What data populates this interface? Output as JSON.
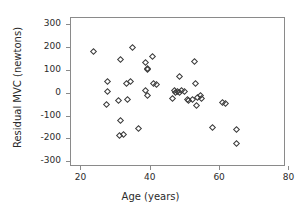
{
  "chart_data": {
    "type": "scatter",
    "title": "",
    "xlabel": "Age (years)",
    "ylabel": "Residual MVC (newtons)",
    "xlim": [
      17,
      79
    ],
    "ylim": [
      -320,
      330
    ],
    "xticks": [
      20,
      40,
      60,
      80
    ],
    "yticks": [
      300,
      200,
      100,
      0,
      -100,
      -200,
      -300
    ],
    "xtick_labels": [
      "20",
      "40",
      "60",
      "80"
    ],
    "ytick_labels": [
      "300",
      "200",
      "100",
      "0",
      "-100",
      "-200",
      "-300"
    ],
    "grid": false,
    "legend": null,
    "marker": "open-diamond",
    "marker_color": "#3a3a3a",
    "frame_color": "#8a8a8a",
    "points": [
      {
        "x": 23.4,
        "y": 182
      },
      {
        "x": 27.6,
        "y": 51
      },
      {
        "x": 27.6,
        "y": 8
      },
      {
        "x": 27.2,
        "y": -47
      },
      {
        "x": 31.2,
        "y": 147
      },
      {
        "x": 30.8,
        "y": -29
      },
      {
        "x": 31.4,
        "y": -115
      },
      {
        "x": 31.0,
        "y": -181
      },
      {
        "x": 32.0,
        "y": -179
      },
      {
        "x": 33.0,
        "y": 46
      },
      {
        "x": 34.2,
        "y": 52
      },
      {
        "x": 33.4,
        "y": -27
      },
      {
        "x": 34.8,
        "y": 202
      },
      {
        "x": 36.6,
        "y": -153
      },
      {
        "x": 38.6,
        "y": 136
      },
      {
        "x": 38.4,
        "y": 14
      },
      {
        "x": 39.0,
        "y": 110
      },
      {
        "x": 39.2,
        "y": 104
      },
      {
        "x": 39.0,
        "y": -9
      },
      {
        "x": 40.6,
        "y": 164
      },
      {
        "x": 40.8,
        "y": 44
      },
      {
        "x": 41.6,
        "y": 42
      },
      {
        "x": 46.2,
        "y": -21
      },
      {
        "x": 46.8,
        "y": 12
      },
      {
        "x": 47.2,
        "y": 6
      },
      {
        "x": 47.8,
        "y": 10
      },
      {
        "x": 48.4,
        "y": 4
      },
      {
        "x": 48.2,
        "y": 76
      },
      {
        "x": 49.0,
        "y": 12
      },
      {
        "x": 49.6,
        "y": 9
      },
      {
        "x": 50.6,
        "y": -25
      },
      {
        "x": 51.0,
        "y": -32
      },
      {
        "x": 52.0,
        "y": -24
      },
      {
        "x": 52.6,
        "y": 142
      },
      {
        "x": 52.8,
        "y": 44
      },
      {
        "x": 53.4,
        "y": -17
      },
      {
        "x": 53.2,
        "y": -50
      },
      {
        "x": 54.4,
        "y": -9
      },
      {
        "x": 54.6,
        "y": -22
      },
      {
        "x": 57.8,
        "y": -146
      },
      {
        "x": 60.8,
        "y": -39
      },
      {
        "x": 61.6,
        "y": -41
      },
      {
        "x": 64.8,
        "y": -155
      },
      {
        "x": 64.6,
        "y": -218
      }
    ]
  }
}
